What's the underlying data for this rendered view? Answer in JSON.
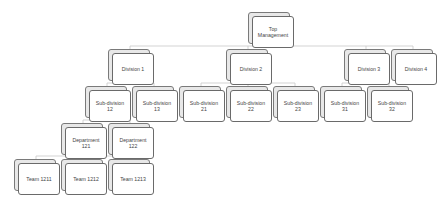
{
  "diagram": {
    "type": "org-chart",
    "nodes": [
      {
        "id": "top",
        "label": "Top\nManagement",
        "parent": null
      },
      {
        "id": "d1",
        "label": "Division 1",
        "parent": "top"
      },
      {
        "id": "d2",
        "label": "Division 2",
        "parent": "top"
      },
      {
        "id": "d3",
        "label": "Division 3",
        "parent": "top"
      },
      {
        "id": "d4",
        "label": "Division 4",
        "parent": "top"
      },
      {
        "id": "s12",
        "label": "Sub-division\n12",
        "parent": "d1"
      },
      {
        "id": "s13",
        "label": "Sub-division\n13",
        "parent": "d1"
      },
      {
        "id": "s21",
        "label": "Sub-division\n21",
        "parent": "d2"
      },
      {
        "id": "s22",
        "label": "Sub-division\n22",
        "parent": "d2"
      },
      {
        "id": "s23",
        "label": "Sub-division\n23",
        "parent": "d2"
      },
      {
        "id": "s31",
        "label": "Sub-division\n31",
        "parent": "d3"
      },
      {
        "id": "s32",
        "label": "Sub-division\n32",
        "parent": "d3"
      },
      {
        "id": "dep121",
        "label": "Department\n121",
        "parent": "s12"
      },
      {
        "id": "dep122",
        "label": "Department\n122",
        "parent": "s12"
      },
      {
        "id": "t1211",
        "label": "Team 1211",
        "parent": "dep121"
      },
      {
        "id": "t1212",
        "label": "Team 1212",
        "parent": "dep121"
      },
      {
        "id": "t1213",
        "label": "Team 1213",
        "parent": "dep121"
      }
    ]
  }
}
